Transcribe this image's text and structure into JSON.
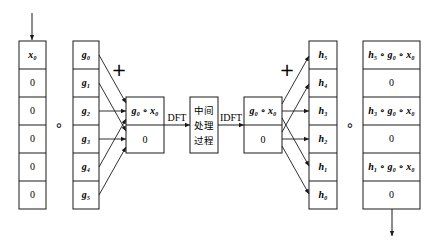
{
  "diagram": {
    "type": "signal-processing-flow",
    "input_column": {
      "cells": [
        "x₀",
        "0",
        "0",
        "0",
        "0",
        "0"
      ]
    },
    "operator_left": "∘",
    "g_column": {
      "cells": [
        "g₀",
        "g₁",
        "g₂",
        "g₃",
        "g₄",
        "g₅"
      ]
    },
    "plus_left": "+",
    "sum_box_left": {
      "cells": [
        "g₀ ∘ x₀",
        "0"
      ]
    },
    "dft_label": "DFT",
    "process_box": {
      "lines": [
        "中间",
        "处理",
        "过程"
      ]
    },
    "idft_label": "IDFT",
    "sum_box_right": {
      "cells": [
        "g₀ ∘ x₀",
        "0"
      ]
    },
    "plus_right": "+",
    "h_column": {
      "cells": [
        "h₅",
        "h₄",
        "h₃",
        "h₂",
        "h₁",
        "h₀"
      ]
    },
    "operator_right": "∘",
    "output_column": {
      "cells": [
        "h₅ ∘ g₀ ∘ x₀",
        "0",
        "h₃ ∘ g₀ ∘ x₀",
        "0",
        "h₁ ∘ g₀ ∘ x₀",
        "0"
      ]
    }
  },
  "colors": {
    "stroke": "#1a1a1a",
    "background": "#ffffff"
  }
}
